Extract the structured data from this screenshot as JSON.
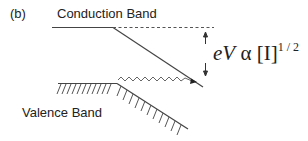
{
  "diagram": {
    "panel_label": "(b)",
    "conduction_band_label": "Conduction Band",
    "valence_band_label": "Valence  Band",
    "equation": {
      "lhs": "eV",
      "symbol": "α",
      "rhs": "[I]",
      "exponent": "1 / 2"
    },
    "colors": {
      "line": "#333333",
      "text": "#222222",
      "background": "#ffffff"
    }
  }
}
